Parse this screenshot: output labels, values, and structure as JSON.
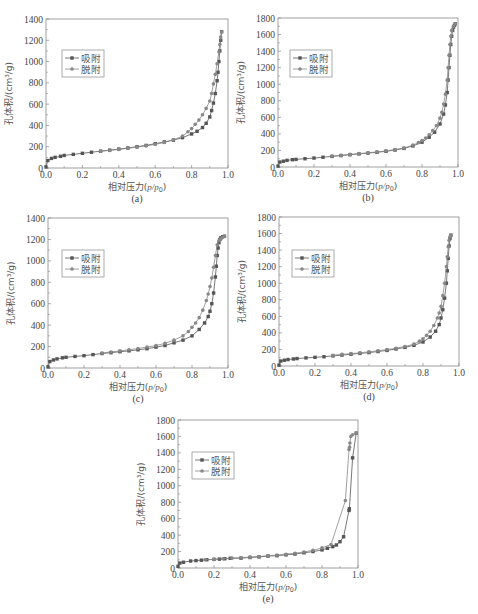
{
  "figure": {
    "legend": {
      "adsorption": "吸附",
      "desorption": "脱附"
    },
    "xlabel": "相对压力(p/p0)",
    "xlabel_parts": {
      "prefix": "相对压力(",
      "p": "p",
      "slash": "/",
      "p0": "p",
      "sub0": "0",
      "suffix": ")"
    },
    "ylabel": "孔体积/(cm³/g)",
    "colors": {
      "adsorption": "#555555",
      "desorption": "#888888",
      "frame": "#888888"
    }
  },
  "chart_data": [
    {
      "id": "a",
      "type": "line",
      "label": "(a)",
      "frame": {
        "x": 46,
        "y": 19,
        "w": 182,
        "h": 149
      },
      "xlabel": "相对压力(p/p0)",
      "ylabel": "孔体积/(cm³/g)",
      "xlim": [
        0,
        1.0
      ],
      "ylim": [
        0,
        1400
      ],
      "xticks": [
        0.0,
        0.2,
        0.4,
        0.6,
        0.8,
        1.0
      ],
      "yticks": [
        0,
        200,
        400,
        600,
        800,
        1000,
        1200,
        1400
      ],
      "legend_pos": {
        "x": 62,
        "y": 50
      },
      "series": [
        {
          "name": "吸附",
          "x": [
            0.0,
            0.01,
            0.03,
            0.05,
            0.08,
            0.1,
            0.15,
            0.2,
            0.25,
            0.3,
            0.35,
            0.4,
            0.45,
            0.5,
            0.55,
            0.6,
            0.65,
            0.7,
            0.75,
            0.8,
            0.83,
            0.86,
            0.88,
            0.9,
            0.91,
            0.92,
            0.93,
            0.94,
            0.945,
            0.95,
            0.955,
            0.96,
            0.965
          ],
          "y": [
            10,
            70,
            90,
            100,
            110,
            118,
            128,
            138,
            148,
            158,
            168,
            178,
            188,
            200,
            212,
            228,
            245,
            262,
            285,
            320,
            345,
            380,
            420,
            480,
            540,
            610,
            700,
            820,
            900,
            1000,
            1100,
            1200,
            1280
          ]
        },
        {
          "name": "脱附",
          "x": [
            0.965,
            0.96,
            0.955,
            0.95,
            0.94,
            0.93,
            0.92,
            0.91,
            0.9,
            0.88,
            0.86,
            0.84,
            0.82,
            0.8,
            0.78,
            0.75,
            0.7,
            0.65,
            0.6,
            0.55,
            0.5,
            0.45,
            0.4,
            0.35,
            0.3
          ],
          "y": [
            1280,
            1230,
            1160,
            1090,
            980,
            880,
            790,
            700,
            630,
            560,
            500,
            450,
            410,
            370,
            340,
            300,
            265,
            240,
            222,
            208,
            196,
            185,
            175,
            165,
            158
          ]
        }
      ]
    },
    {
      "id": "b",
      "type": "line",
      "label": "(b)",
      "frame": {
        "x": 278,
        "y": 18,
        "w": 180,
        "h": 149
      },
      "xlabel": "相对压力(p/p0)",
      "ylabel": "孔体积/(cm³/g)",
      "xlim": [
        0,
        1.0
      ],
      "ylim": [
        0,
        1800
      ],
      "xticks": [
        0.0,
        0.2,
        0.4,
        0.6,
        0.8,
        1.0
      ],
      "yticks": [
        0,
        200,
        400,
        600,
        800,
        1000,
        1200,
        1400,
        1600,
        1800
      ],
      "legend_pos": {
        "x": 290,
        "y": 50
      },
      "series": [
        {
          "name": "吸附",
          "x": [
            0.0,
            0.01,
            0.03,
            0.05,
            0.08,
            0.1,
            0.15,
            0.2,
            0.25,
            0.3,
            0.35,
            0.4,
            0.45,
            0.5,
            0.55,
            0.6,
            0.65,
            0.7,
            0.75,
            0.8,
            0.84,
            0.87,
            0.9,
            0.92,
            0.93,
            0.94,
            0.945,
            0.95,
            0.955,
            0.96,
            0.965,
            0.97,
            0.975,
            0.98,
            0.985
          ],
          "y": [
            10,
            60,
            70,
            80,
            88,
            92,
            100,
            108,
            118,
            128,
            138,
            148,
            158,
            168,
            178,
            190,
            205,
            225,
            255,
            300,
            360,
            420,
            520,
            640,
            750,
            900,
            1050,
            1200,
            1350,
            1480,
            1580,
            1650,
            1690,
            1710,
            1730
          ]
        },
        {
          "name": "脱附",
          "x": [
            0.985,
            0.975,
            0.965,
            0.96,
            0.955,
            0.95,
            0.945,
            0.94,
            0.93,
            0.92,
            0.91,
            0.9,
            0.88,
            0.86,
            0.84,
            0.82,
            0.8,
            0.78,
            0.75,
            0.7,
            0.65,
            0.6,
            0.55,
            0.5,
            0.45,
            0.4,
            0.35,
            0.3
          ],
          "y": [
            1730,
            1700,
            1650,
            1580,
            1480,
            1350,
            1200,
            1050,
            880,
            760,
            660,
            590,
            500,
            440,
            390,
            350,
            320,
            295,
            265,
            230,
            210,
            195,
            182,
            172,
            162,
            152,
            142,
            132
          ]
        }
      ]
    },
    {
      "id": "c",
      "type": "line",
      "label": "(c)",
      "frame": {
        "x": 48,
        "y": 218,
        "w": 180,
        "h": 150
      },
      "xlabel": "相对压力(p/p0)",
      "ylabel": "孔体积/(cm³/g)",
      "xlim": [
        0,
        1.0
      ],
      "ylim": [
        0,
        1400
      ],
      "xticks": [
        0.0,
        0.2,
        0.4,
        0.6,
        0.8,
        1.0
      ],
      "yticks": [
        0,
        200,
        400,
        600,
        800,
        1000,
        1200,
        1400
      ],
      "legend_pos": {
        "x": 62,
        "y": 250
      },
      "series": [
        {
          "name": "吸附",
          "x": [
            0.0,
            0.01,
            0.03,
            0.05,
            0.08,
            0.1,
            0.15,
            0.2,
            0.25,
            0.3,
            0.35,
            0.4,
            0.45,
            0.5,
            0.55,
            0.6,
            0.65,
            0.7,
            0.75,
            0.8,
            0.84,
            0.87,
            0.89,
            0.9,
            0.91,
            0.92,
            0.93,
            0.935,
            0.94,
            0.945,
            0.95,
            0.955,
            0.96,
            0.97,
            0.98
          ],
          "y": [
            10,
            60,
            75,
            85,
            95,
            100,
            108,
            115,
            125,
            135,
            143,
            152,
            160,
            170,
            180,
            195,
            210,
            235,
            260,
            300,
            360,
            420,
            480,
            530,
            600,
            700,
            850,
            950,
            1050,
            1120,
            1170,
            1200,
            1215,
            1225,
            1230
          ]
        },
        {
          "name": "脱附",
          "x": [
            0.98,
            0.97,
            0.96,
            0.95,
            0.94,
            0.93,
            0.92,
            0.91,
            0.9,
            0.89,
            0.88,
            0.86,
            0.84,
            0.82,
            0.8,
            0.78,
            0.75,
            0.7,
            0.65,
            0.6,
            0.55,
            0.5,
            0.45,
            0.4,
            0.35,
            0.3
          ],
          "y": [
            1230,
            1220,
            1205,
            1190,
            1150,
            1050,
            940,
            840,
            760,
            690,
            630,
            540,
            470,
            420,
            380,
            340,
            300,
            260,
            230,
            210,
            195,
            182,
            170,
            160,
            150,
            140
          ]
        }
      ]
    },
    {
      "id": "d",
      "type": "line",
      "label": "(d)",
      "frame": {
        "x": 279,
        "y": 217,
        "w": 180,
        "h": 149
      },
      "xlabel": "相对压力(p/p0)",
      "ylabel": "孔体积/(cm³/g)",
      "xlim": [
        0,
        1.0
      ],
      "ylim": [
        0,
        1800
      ],
      "xticks": [
        0.0,
        0.2,
        0.4,
        0.6,
        0.8,
        1.0
      ],
      "yticks": [
        0,
        200,
        400,
        600,
        800,
        1000,
        1200,
        1400,
        1600,
        1800
      ],
      "legend_pos": {
        "x": 292,
        "y": 250
      },
      "series": [
        {
          "name": "吸附",
          "x": [
            0.0,
            0.01,
            0.03,
            0.05,
            0.08,
            0.1,
            0.15,
            0.2,
            0.25,
            0.3,
            0.35,
            0.4,
            0.45,
            0.5,
            0.55,
            0.6,
            0.65,
            0.7,
            0.75,
            0.8,
            0.84,
            0.87,
            0.89,
            0.9,
            0.91,
            0.92,
            0.93,
            0.935,
            0.94,
            0.945,
            0.95,
            0.955
          ],
          "y": [
            10,
            60,
            70,
            78,
            85,
            90,
            98,
            105,
            112,
            122,
            132,
            142,
            152,
            162,
            175,
            188,
            205,
            225,
            250,
            290,
            350,
            420,
            500,
            580,
            680,
            820,
            1000,
            1150,
            1300,
            1450,
            1540,
            1580
          ]
        },
        {
          "name": "脱附",
          "x": [
            0.955,
            0.95,
            0.945,
            0.94,
            0.935,
            0.93,
            0.92,
            0.91,
            0.9,
            0.89,
            0.88,
            0.86,
            0.84,
            0.82,
            0.8,
            0.78,
            0.75,
            0.7,
            0.65,
            0.6,
            0.55,
            0.5,
            0.45,
            0.4,
            0.35,
            0.3
          ],
          "y": [
            1580,
            1560,
            1520,
            1440,
            1320,
            1200,
            1000,
            850,
            720,
            640,
            580,
            490,
            420,
            370,
            330,
            300,
            265,
            235,
            215,
            198,
            185,
            172,
            160,
            150,
            140,
            130
          ]
        }
      ]
    },
    {
      "id": "e",
      "type": "line",
      "label": "(e)",
      "frame": {
        "x": 178,
        "y": 420,
        "w": 180,
        "h": 148
      },
      "xlabel": "相对压力(p/p0)",
      "ylabel": "孔体积/(cm³/g)",
      "xlim": [
        0,
        1.0
      ],
      "ylim": [
        0,
        1800
      ],
      "xticks": [
        0.0,
        0.2,
        0.4,
        0.6,
        0.8,
        1.0
      ],
      "yticks": [
        0,
        200,
        400,
        600,
        800,
        1000,
        1200,
        1400,
        1600,
        1800
      ],
      "legend_pos": {
        "x": 192,
        "y": 452
      },
      "series": [
        {
          "name": "吸附",
          "x": [
            0.0,
            0.01,
            0.03,
            0.07,
            0.1,
            0.13,
            0.16,
            0.2,
            0.23,
            0.26,
            0.29,
            0.35,
            0.4,
            0.45,
            0.5,
            0.55,
            0.6,
            0.65,
            0.7,
            0.75,
            0.8,
            0.83,
            0.86,
            0.88,
            0.9,
            0.92,
            0.95,
            0.952,
            0.97,
            0.99
          ],
          "y": [
            20,
            60,
            70,
            85,
            90,
            95,
            100,
            105,
            108,
            112,
            118,
            120,
            128,
            135,
            145,
            150,
            160,
            170,
            185,
            200,
            220,
            240,
            260,
            280,
            320,
            380,
            700,
            720,
            1340,
            1640
          ]
        },
        {
          "name": "脱附",
          "x": [
            0.99,
            0.97,
            0.96,
            0.955,
            0.953,
            0.95,
            0.93,
            0.85,
            0.8,
            0.75,
            0.7,
            0.65,
            0.6,
            0.55,
            0.5,
            0.45,
            0.4,
            0.35,
            0.3,
            0.25,
            0.2,
            0.15
          ],
          "y": [
            1640,
            1620,
            1600,
            1520,
            1470,
            1440,
            820,
            285,
            245,
            215,
            195,
            180,
            168,
            158,
            150,
            140,
            132,
            125,
            120,
            112,
            105,
            100
          ]
        }
      ]
    }
  ]
}
